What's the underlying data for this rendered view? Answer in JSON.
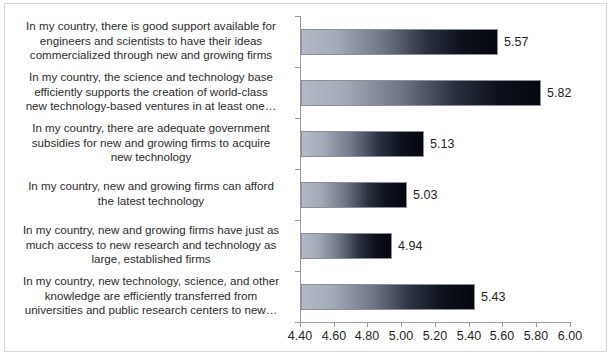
{
  "chart_data": {
    "type": "bar",
    "orientation": "horizontal",
    "title": "",
    "subtitle": "",
    "xlabel": "",
    "ylabel": "",
    "xlim": [
      4.4,
      6.0
    ],
    "xtick_step": 0.2,
    "grid": false,
    "legend": false,
    "categories": [
      "In my country, there is good support available for\nengineers and scientists to have their ideas\ncommercialized through new and growing firms",
      "In my country, the science and technology base\nefficiently supports the creation of world-class\nnew technology-based ventures in at least one…",
      "In my country, there are adequate government\nsubsidies for new and growing firms to acquire\nnew technology",
      "In my country, new and growing firms can afford\nthe latest technology",
      "In my country, new and growing firms have just as\nmuch access to new research and technology as\nlarge, established firms",
      "In my country, new technology, science, and other\nknowledge are efficiently transferred from\nuniversities and public research centers to new…"
    ],
    "values": [
      5.57,
      5.82,
      5.13,
      5.03,
      4.94,
      5.43
    ],
    "value_labels": [
      "5.57",
      "5.82",
      "5.13",
      "5.03",
      "4.94",
      "5.43"
    ],
    "xticks": [
      4.4,
      4.6,
      4.8,
      5.0,
      5.2,
      5.4,
      5.6,
      5.8,
      6.0
    ],
    "xtick_labels": [
      "4.40",
      "4.60",
      "4.80",
      "5.00",
      "5.20",
      "5.40",
      "5.60",
      "5.80",
      "6.00"
    ],
    "colors": {
      "bar_gradient_start": "#b3bac6",
      "bar_gradient_end": "#05070e",
      "bar_border": "#8a8f99",
      "axis": "#9a9a9a",
      "text": "#231f20",
      "frame_border": "#d6d6d6",
      "background": "#ffffff"
    }
  }
}
